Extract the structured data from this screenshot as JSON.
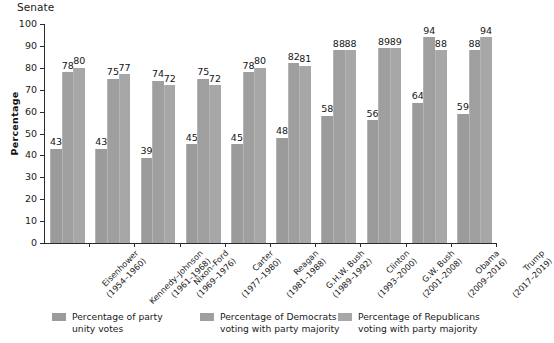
{
  "chart_data": {
    "type": "bar",
    "title": "Senate",
    "xlabel": "",
    "ylabel": "Percentage",
    "ylim": [
      0,
      100
    ],
    "ytick_values": [
      0,
      10,
      20,
      30,
      40,
      50,
      60,
      70,
      80,
      90,
      100
    ],
    "ytick_labels": [
      "0",
      "10",
      "20",
      "30",
      "40",
      "50",
      "60",
      "70",
      "80",
      "90",
      "100"
    ],
    "grid": false,
    "legend_position": "bottom",
    "categories": [
      "Eisenhower\n(1954–1960)",
      "Kennedy–Johnson\n(1961–1968)",
      "Nixon–Ford\n(1969–1976)",
      "Carter\n(1977–1980)",
      "Reagan\n(1981–1988)",
      "G.H.W. Bush\n(1989–1992)",
      "Clinton\n(1993–2000)",
      "G.W. Bush\n(2001–2008)",
      "Obama\n(2009–2016)",
      "Trump\n(2017–2019)"
    ],
    "category_lines": [
      [
        "Eisenhower",
        "(1954–1960)"
      ],
      [
        "Kennedy–Johnson",
        "(1961–1968)"
      ],
      [
        "Nixon–Ford",
        "(1969–1976)"
      ],
      [
        "Carter",
        "(1977–1980)"
      ],
      [
        "Reagan",
        "(1981–1988)"
      ],
      [
        "G.H.W. Bush",
        "(1989–1992)"
      ],
      [
        "Clinton",
        "(1993–2000)"
      ],
      [
        "G.W. Bush",
        "(2001–2008)"
      ],
      [
        "Obama",
        "(2009–2016)"
      ],
      [
        "Trump",
        "(2017–2019)"
      ]
    ],
    "series": [
      {
        "name": "Percentage of party unity votes",
        "name_lines": [
          "Percentage of party",
          "unity votes"
        ],
        "color": "#9b9b9b",
        "values": [
          43,
          43,
          39,
          45,
          45,
          48,
          58,
          56,
          64,
          59
        ]
      },
      {
        "name": "Percentage of Democrats voting with party majority",
        "name_lines": [
          "Percentage of Democrats",
          "voting with party majority"
        ],
        "color": "#9f9f9f",
        "values": [
          78,
          75,
          74,
          75,
          78,
          82,
          88,
          89,
          94,
          88
        ]
      },
      {
        "name": "Percentage of Republicans voting with party majority",
        "name_lines": [
          "Percentage of Republicans",
          "voting with party majority"
        ],
        "color": "#a7a7a7",
        "values": [
          80,
          77,
          72,
          72,
          80,
          81,
          88,
          89,
          88,
          94
        ]
      }
    ]
  }
}
